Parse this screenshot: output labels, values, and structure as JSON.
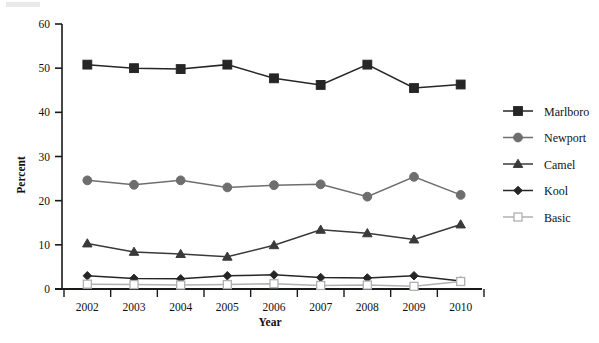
{
  "chart_data": {
    "type": "line",
    "title": "",
    "xlabel": "Year",
    "ylabel": "Percent",
    "categories": [
      2002,
      2003,
      2004,
      2005,
      2006,
      2007,
      2008,
      2009,
      2010
    ],
    "xtick_labels": [
      "2002",
      "2003",
      "2004",
      "2005",
      "2006",
      "2007",
      "2008",
      "2009",
      "2010"
    ],
    "ytick_labels": [
      "0",
      "10",
      "20",
      "30",
      "40",
      "50",
      "60"
    ],
    "yticks": [
      0,
      10,
      20,
      30,
      40,
      50,
      60
    ],
    "ylim": [
      0,
      60
    ],
    "grid": false,
    "legend_position": "right",
    "series": [
      {
        "name": "Marlboro",
        "marker": "filled-square",
        "color": "#262626",
        "values": [
          50.8,
          50.0,
          49.8,
          50.8,
          47.7,
          46.2,
          50.8,
          45.5,
          46.3
        ]
      },
      {
        "name": "Newport",
        "marker": "filled-circle",
        "color": "#6e6e6e",
        "values": [
          24.6,
          23.6,
          24.6,
          23.0,
          23.5,
          23.7,
          20.9,
          25.4,
          21.3
        ]
      },
      {
        "name": "Camel",
        "marker": "filled-triangle",
        "color": "#3a3a3a",
        "values": [
          10.3,
          8.4,
          7.9,
          7.3,
          9.9,
          13.4,
          12.6,
          11.2,
          14.6
        ]
      },
      {
        "name": "Kool",
        "marker": "filled-diamond",
        "color": "#262626",
        "values": [
          3.0,
          2.4,
          2.3,
          3.0,
          3.2,
          2.6,
          2.5,
          3.0,
          1.8
        ]
      },
      {
        "name": "Basic",
        "marker": "open-square",
        "color": "#b0b0b0",
        "values": [
          1.1,
          1.0,
          0.9,
          1.0,
          1.2,
          0.8,
          0.9,
          0.6,
          1.7
        ]
      }
    ]
  },
  "legend": {
    "entries": [
      {
        "label": "Marlboro"
      },
      {
        "label": "Newport"
      },
      {
        "label": "Camel"
      },
      {
        "label": "Kool"
      },
      {
        "label": "Basic"
      }
    ]
  },
  "axes": {
    "y_title": "Percent",
    "x_title": "Year"
  }
}
